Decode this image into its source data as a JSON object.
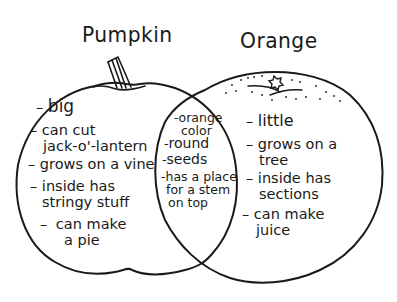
{
  "diagram": {
    "type": "venn",
    "style": "hand-drawn black outline on white",
    "colors": {
      "background": "#ffffff",
      "stroke": "#1a1a1a",
      "text": "#1a1a1a"
    },
    "left_set": {
      "title": "Pumpkin",
      "shape": "pumpkin-outline-with-stem",
      "dash": "–",
      "items": [
        {
          "line1": "big",
          "line2": ""
        },
        {
          "line1": "can cut",
          "line2": "jack-o'-lantern"
        },
        {
          "line1": "grows on a vine",
          "line2": ""
        },
        {
          "line1": "inside has",
          "line2": "stringy stuff"
        },
        {
          "line1": "can make",
          "line2": "a pie"
        }
      ]
    },
    "right_set": {
      "title": "Orange",
      "shape": "orange-outline-with-dimpled-top-and-star-blossom-end",
      "dash": "–",
      "items": [
        {
          "line1": "little",
          "line2": ""
        },
        {
          "line1": "grows on a",
          "line2": "tree"
        },
        {
          "line1": "inside has",
          "line2": "sections"
        },
        {
          "line1": "can make",
          "line2": "juice"
        }
      ]
    },
    "intersection": {
      "shape": "lens-overlap",
      "dash": "-",
      "items": [
        {
          "line1": "orange",
          "line2": "color",
          "line3": ""
        },
        {
          "line1": "round",
          "line2": "",
          "line3": ""
        },
        {
          "line1": "seeds",
          "line2": "",
          "line3": ""
        },
        {
          "line1": "has a place",
          "line2": "for a stem",
          "line3": "on top"
        }
      ]
    }
  }
}
